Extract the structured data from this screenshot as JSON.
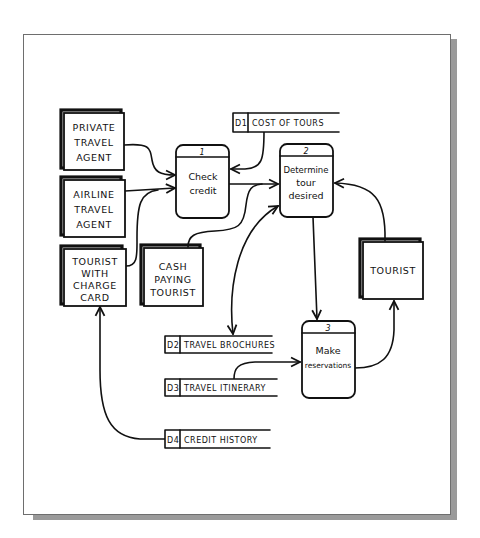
{
  "diagram": {
    "type": "data-flow-diagram",
    "style": "hand-drawn",
    "external_entities": [
      {
        "id": "private-travel-agent",
        "lines": [
          "PRIVATE",
          "TRAVEL",
          "AGENT"
        ]
      },
      {
        "id": "airline-travel-agent",
        "lines": [
          "AIRLINE",
          "TRAVEL",
          "AGENT"
        ]
      },
      {
        "id": "tourist-with-charge-card",
        "lines": [
          "TOURIST",
          "WITH",
          "CHARGE",
          "CARD"
        ]
      },
      {
        "id": "cash-paying-tourist",
        "lines": [
          "CASH",
          "PAYING",
          "TOURIST"
        ]
      },
      {
        "id": "tourist",
        "lines": [
          "TOURIST"
        ]
      }
    ],
    "processes": [
      {
        "number": "1",
        "lines": [
          "Check",
          "credit"
        ]
      },
      {
        "number": "2",
        "lines": [
          "Determine",
          "tour",
          "desired"
        ]
      },
      {
        "number": "3",
        "lines": [
          "Make",
          "reservations"
        ]
      }
    ],
    "data_stores": [
      {
        "id": "D1",
        "label": "COST OF TOURS"
      },
      {
        "id": "D2",
        "label": "TRAVEL BROCHURES"
      },
      {
        "id": "D3",
        "label": "TRAVEL ITINERARY"
      },
      {
        "id": "D4",
        "label": "CREDIT HISTORY"
      }
    ],
    "flows": [
      {
        "from": "PRIVATE TRAVEL AGENT",
        "to": "1 Check credit"
      },
      {
        "from": "AIRLINE TRAVEL AGENT",
        "to": "1 Check credit"
      },
      {
        "from": "TOURIST WITH CHARGE CARD",
        "to": "1 Check credit"
      },
      {
        "from": "D1 COST OF TOURS",
        "to": "1 Check credit"
      },
      {
        "from": "1 Check credit",
        "to": "2 Determine tour desired"
      },
      {
        "from": "CASH PAYING TOURIST",
        "to": "2 Determine tour desired"
      },
      {
        "from": "D2 TRAVEL BROCHURES",
        "to": "2 Determine tour desired",
        "bidirectional": true
      },
      {
        "from": "TOURIST",
        "to": "2 Determine tour desired"
      },
      {
        "from": "2 Determine tour desired",
        "to": "3 Make reservations"
      },
      {
        "from": "D3 TRAVEL ITINERARY",
        "to": "3 Make reservations"
      },
      {
        "from": "3 Make reservations",
        "to": "TOURIST"
      },
      {
        "from": "D4 CREDIT HISTORY",
        "to": "TOURIST WITH CHARGE CARD"
      }
    ]
  }
}
